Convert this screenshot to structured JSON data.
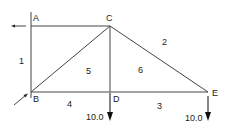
{
  "diagram": {
    "type": "truss",
    "nodes": [
      {
        "id": "A",
        "label": "A",
        "x": 31,
        "y": 26
      },
      {
        "id": "B",
        "label": "B",
        "x": 31,
        "y": 92
      },
      {
        "id": "C",
        "label": "C",
        "x": 110,
        "y": 26
      },
      {
        "id": "D",
        "label": "D",
        "x": 110,
        "y": 92
      },
      {
        "id": "E",
        "label": "E",
        "x": 208,
        "y": 92
      }
    ],
    "members": [
      {
        "id": "1",
        "label": "1",
        "from": "A",
        "to": "B"
      },
      {
        "id": "2",
        "label": "2",
        "from": "C",
        "to": "E"
      },
      {
        "id": "3",
        "label": "3",
        "from": "D",
        "to": "E"
      },
      {
        "id": "4",
        "label": "4",
        "from": "B",
        "to": "D"
      },
      {
        "id": "5",
        "label": "5",
        "from": "B",
        "to": "C"
      },
      {
        "id": "6",
        "label": "6",
        "from": "C",
        "to": "D"
      },
      {
        "id": "AC",
        "label": "",
        "from": "A",
        "to": "C"
      }
    ],
    "loads": [
      {
        "node": "D",
        "value": "10.0",
        "direction": "down"
      },
      {
        "node": "E",
        "value": "10.0",
        "direction": "down"
      }
    ],
    "reactions": [
      {
        "node": "A",
        "direction": "left"
      },
      {
        "node": "B",
        "direction": "diagonal-up-right"
      }
    ],
    "colors": {
      "line": "#444444",
      "text": "#222222",
      "background": "#ffffff"
    }
  }
}
